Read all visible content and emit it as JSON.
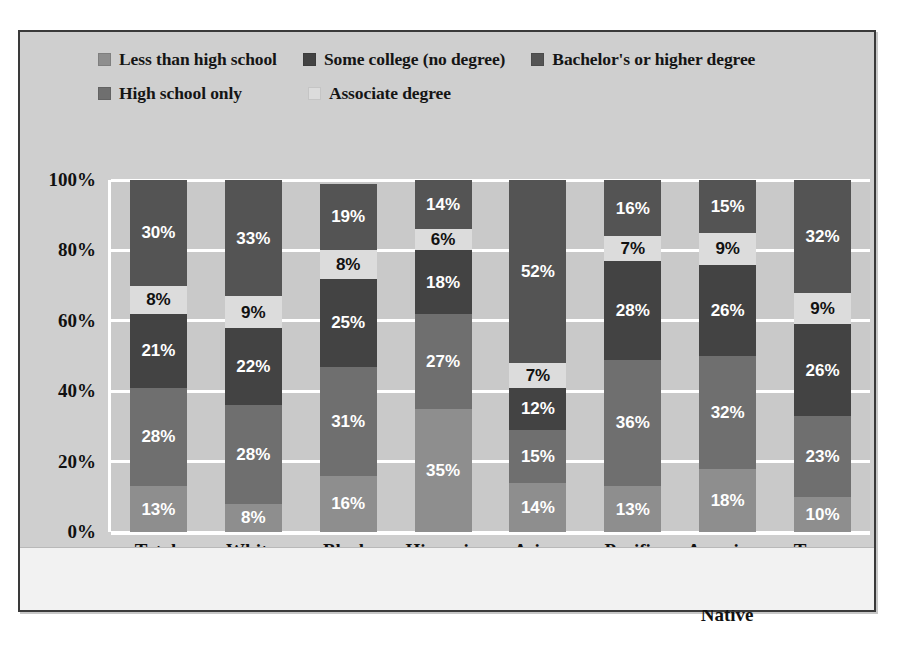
{
  "chart_data": {
    "type": "bar",
    "stacked": true,
    "orientation": "vertical",
    "title": "",
    "subtitle": "",
    "xlabel": "",
    "ylabel": "",
    "ylim": [
      0,
      100
    ],
    "yticks": [
      "0%",
      "20%",
      "40%",
      "60%",
      "80%",
      "100%"
    ],
    "ytick_values": [
      0,
      20,
      40,
      60,
      80,
      100
    ],
    "grid": true,
    "grid_color": "#ffffff",
    "plot_background": "#c9c9c9",
    "legend_position": "top",
    "categories": [
      "Total",
      "White",
      "Black",
      "Hispanic",
      "Asian",
      "Pacific Islander",
      "American Indian/ Alaska Native",
      "Two or more races"
    ],
    "category_label_lines": [
      [
        "Total"
      ],
      [
        "White"
      ],
      [
        "Black"
      ],
      [
        "Hispanic"
      ],
      [
        "Asian"
      ],
      [
        "Pacific",
        "Islander"
      ],
      [
        "American",
        "Indian/",
        "Alaska Native"
      ],
      [
        "Two or",
        "more races"
      ]
    ],
    "series": [
      {
        "name": "Less than high school",
        "color": "#8e8e8e",
        "values": [
          13,
          8,
          16,
          35,
          14,
          13,
          18,
          10
        ],
        "labels": [
          "13%",
          "8%",
          "16%",
          "35%",
          "14%",
          "13%",
          "18%",
          "10%"
        ]
      },
      {
        "name": "High school only",
        "color": "#6f6f6f",
        "values": [
          28,
          28,
          31,
          27,
          15,
          36,
          32,
          23
        ],
        "labels": [
          "28%",
          "28%",
          "31%",
          "27%",
          "15%",
          "36%",
          "32%",
          "23%"
        ]
      },
      {
        "name": "Some college (no degree)",
        "color": "#434343",
        "values": [
          21,
          22,
          25,
          18,
          12,
          28,
          26,
          26
        ],
        "labels": [
          "21%",
          "22%",
          "25%",
          "18%",
          "12%",
          "28%",
          "26%",
          "26%"
        ]
      },
      {
        "name": "Associate degree",
        "color": "#dcdcdc",
        "values": [
          8,
          9,
          8,
          6,
          7,
          7,
          9,
          9
        ],
        "labels": [
          "8%",
          "9%",
          "8%",
          "6%",
          "7%",
          "7%",
          "9%",
          "9%"
        ]
      },
      {
        "name": "Bachelor's or higher degree",
        "color": "#545454",
        "values": [
          30,
          33,
          19,
          14,
          52,
          16,
          15,
          32
        ],
        "labels": [
          "30%",
          "33%",
          "19%",
          "14%",
          "52%",
          "16%",
          "15%",
          "32%"
        ]
      }
    ]
  },
  "legend": {
    "rows": [
      [
        {
          "label": "Less than high school",
          "color": "#8e8e8e",
          "swatch_name": "legend-swatch-less-than-high-school"
        },
        {
          "label": "Some college (no degree)",
          "color": "#434343",
          "swatch_name": "legend-swatch-some-college"
        },
        {
          "label": "Bachelor's or higher degree",
          "color": "#545454",
          "swatch_name": "legend-swatch-bachelors-or-higher"
        }
      ],
      [
        {
          "label": "High school only",
          "color": "#6f6f6f",
          "swatch_name": "legend-swatch-high-school-only"
        },
        {
          "label": "Associate degree",
          "color": "#dcdcdc",
          "swatch_name": "legend-swatch-associate-degree"
        }
      ]
    ]
  }
}
